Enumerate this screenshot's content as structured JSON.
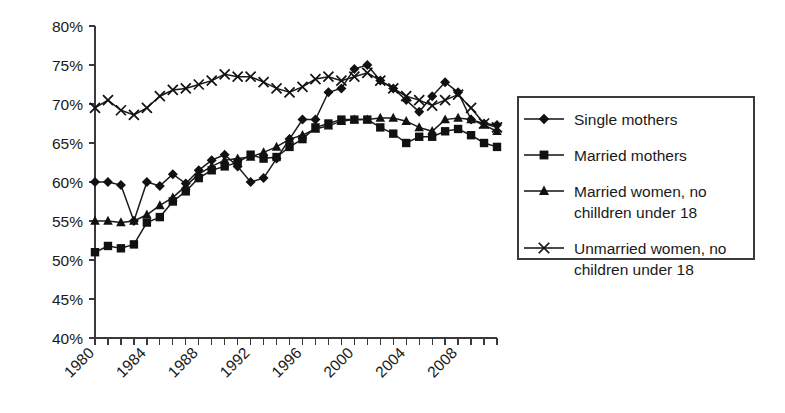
{
  "chart_data": {
    "type": "line",
    "title": "",
    "subtitle": "",
    "xlabel": "",
    "ylabel": "",
    "xlim": [
      1980,
      2011
    ],
    "ylim": [
      40,
      80
    ],
    "ytick_step": 5,
    "xtick_step": 1,
    "xlabel_step": 4,
    "grid": false,
    "legend_position": "right",
    "ytick_labels": [
      "40%",
      "45%",
      "50%",
      "55%",
      "60%",
      "65%",
      "70%",
      "75%",
      "80%"
    ],
    "ytick_values": [
      40,
      45,
      50,
      55,
      60,
      65,
      70,
      75,
      80
    ],
    "x": [
      1980,
      1981,
      1982,
      1983,
      1984,
      1985,
      1986,
      1987,
      1988,
      1989,
      1990,
      1991,
      1992,
      1993,
      1994,
      1995,
      1996,
      1997,
      1998,
      1999,
      2000,
      2001,
      2002,
      2003,
      2004,
      2005,
      2006,
      2007,
      2008,
      2009,
      2010,
      2011
    ],
    "xtick_labels": [
      "1980",
      "",
      "",
      "",
      "1984",
      "",
      "",
      "",
      "1988",
      "",
      "",
      "",
      "1992",
      "",
      "",
      "",
      "1996",
      "",
      "",
      "",
      "2000",
      "",
      "",
      "",
      "2004",
      "",
      "",
      "",
      "2008",
      "",
      "",
      ""
    ],
    "series": [
      {
        "name": "Single mothers",
        "marker": "diamond",
        "values": [
          60.0,
          60.0,
          59.6,
          55.0,
          60.0,
          59.5,
          61.0,
          59.8,
          61.5,
          62.8,
          63.5,
          62.0,
          60.0,
          60.5,
          63.0,
          65.5,
          68.0,
          68.0,
          71.5,
          72.0,
          74.5,
          75.0,
          73.0,
          72.0,
          70.5,
          69.0,
          71.0,
          72.8,
          71.5,
          68.0,
          67.5,
          67.3
        ]
      },
      {
        "name": "Married mothers",
        "marker": "square",
        "values": [
          51.0,
          51.8,
          51.5,
          52.0,
          54.8,
          55.5,
          57.5,
          58.8,
          60.5,
          61.5,
          62.0,
          62.5,
          63.5,
          63.0,
          63.2,
          64.5,
          65.5,
          67.0,
          67.5,
          68.0,
          68.0,
          68.0,
          67.0,
          66.2,
          65.0,
          65.8,
          65.8,
          66.5,
          66.8,
          66.0,
          65.0,
          64.5
        ]
      },
      {
        "name": "Married women, no chilldren under 18",
        "marker": "triangle",
        "values": [
          55.0,
          55.0,
          54.8,
          55.0,
          55.8,
          57.0,
          58.0,
          59.5,
          61.0,
          62.0,
          62.8,
          63.0,
          63.2,
          63.8,
          64.5,
          65.5,
          66.0,
          66.8,
          67.2,
          67.8,
          68.0,
          68.0,
          68.2,
          68.2,
          67.8,
          67.0,
          66.5,
          68.0,
          68.2,
          68.0,
          67.3,
          66.5
        ]
      },
      {
        "name": "Unmarried women, no children under 18",
        "marker": "x",
        "values": [
          69.5,
          70.5,
          69.2,
          68.6,
          69.5,
          71.0,
          71.8,
          72.0,
          72.5,
          73.0,
          73.8,
          73.5,
          73.5,
          72.8,
          72.0,
          71.5,
          72.2,
          73.2,
          73.5,
          73.0,
          73.5,
          74.0,
          73.0,
          72.0,
          71.0,
          70.5,
          69.8,
          70.5,
          71.2,
          69.5,
          67.5,
          67.0
        ]
      }
    ]
  },
  "legend": {
    "entries": [
      {
        "label": "Single mothers",
        "label2": "",
        "marker": "diamond"
      },
      {
        "label": "Married mothers",
        "label2": "",
        "marker": "square"
      },
      {
        "label": "Married women, no",
        "label2": "chilldren under 18",
        "marker": "triangle"
      },
      {
        "label": "Unmarried women, no",
        "label2": "children under 18",
        "marker": "x"
      }
    ]
  },
  "colors": {
    "ink": "#111111",
    "axis": "#3a3a3a",
    "background": "#ffffff"
  }
}
